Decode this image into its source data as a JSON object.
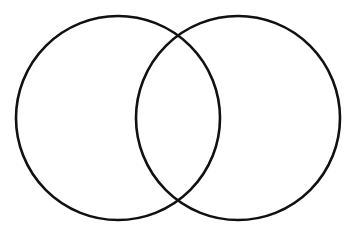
{
  "document": {
    "type": "venn-diagram",
    "title": "",
    "width": 357,
    "height": 239,
    "background_color": "#FFFFFF"
  },
  "chart_data": {
    "type": "diagram",
    "subtype": "venn-2-set",
    "title": "",
    "xlabel": "",
    "ylabel": "",
    "grid": false,
    "legend": "none",
    "background_color": "#FFFFFF",
    "stroke_color": "#111111",
    "stroke_width": 2.6,
    "fill": "none",
    "sets": [
      {
        "name": "left-set",
        "label": "",
        "cx": 118,
        "cy": 118,
        "r": 102,
        "fill": "none",
        "stroke": "#111111"
      },
      {
        "name": "right-set",
        "label": "",
        "cx": 238,
        "cy": 118,
        "r": 102,
        "fill": "none",
        "stroke": "#111111"
      }
    ],
    "regions": [
      {
        "name": "left-only",
        "label": "",
        "value": null
      },
      {
        "name": "intersection",
        "label": "",
        "value": null
      },
      {
        "name": "right-only",
        "label": "",
        "value": null
      }
    ],
    "geometry": {
      "left_extent_x": 16,
      "right_extent_x": 340,
      "top_extent_y": 16,
      "bottom_extent_y": 220,
      "center_distance": 120,
      "intersection_top": {
        "x": 178,
        "y": 33
      },
      "intersection_bottom": {
        "x": 178,
        "y": 203
      }
    }
  }
}
